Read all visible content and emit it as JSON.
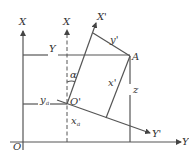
{
  "diagram": {
    "type": "coordinate-transformation",
    "colors": {
      "line": "#555555",
      "text": "#333333",
      "background": "#ffffff"
    },
    "labels": {
      "origin": "O",
      "global_x": "X",
      "global_x_dashed": "X",
      "global_y_top": "Y",
      "global_y_bottom": "Y",
      "local_origin": "O'",
      "local_x": "X'",
      "local_y": "Y'",
      "point": "A",
      "angle": "α",
      "ya": "y",
      "ya_sub": "a",
      "xa": "x",
      "xa_sub": "a",
      "x_prime": "x'",
      "y_prime": "y'",
      "z": "z"
    }
  }
}
